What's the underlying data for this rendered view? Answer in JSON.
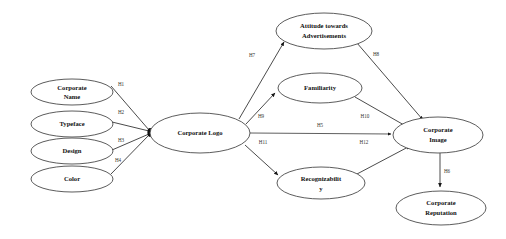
{
  "diagram": {
    "background_color": "#ffffff",
    "node_stroke_color": "#4a4a4a",
    "edge_color": "#2a2a2a",
    "text_color": "#111111",
    "nodes": [
      {
        "id": "corporate-name",
        "label_line1": "Corporate",
        "label_line2": "Name",
        "cx": 72,
        "cy": 92,
        "rx": 41,
        "ry": 13
      },
      {
        "id": "typeface",
        "label_line1": "Typeface",
        "label_line2": "",
        "cx": 72,
        "cy": 124,
        "rx": 41,
        "ry": 13
      },
      {
        "id": "design",
        "label_line1": "Design",
        "label_line2": "",
        "cx": 72,
        "cy": 151,
        "rx": 41,
        "ry": 13
      },
      {
        "id": "color",
        "label_line1": "Color",
        "label_line2": "",
        "cx": 72,
        "cy": 179,
        "rx": 41,
        "ry": 13
      },
      {
        "id": "corporate-logo",
        "label_line1": "Corporate Logo",
        "label_line2": "",
        "cx": 200,
        "cy": 133,
        "rx": 50,
        "ry": 20
      },
      {
        "id": "attitude-towards-ads",
        "label_line1": "Attitude towards",
        "label_line2": "Advertisements",
        "cx": 324,
        "cy": 31,
        "rx": 48,
        "ry": 18
      },
      {
        "id": "familiarity",
        "label_line1": "Familiarity",
        "label_line2": "",
        "cx": 320,
        "cy": 88,
        "rx": 42,
        "ry": 15
      },
      {
        "id": "recognizability",
        "label_line1": "Recognizabilit",
        "label_line2": "y",
        "cx": 321,
        "cy": 183,
        "rx": 44,
        "ry": 16
      },
      {
        "id": "corporate-image",
        "label_line1": "Corporate",
        "label_line2": "Image",
        "cx": 438,
        "cy": 135,
        "rx": 45,
        "ry": 18
      },
      {
        "id": "corporate-reputation",
        "label_line1": "Corporate",
        "label_line2": "Reputation",
        "cx": 441,
        "cy": 208,
        "rx": 45,
        "ry": 17
      }
    ],
    "edges": [
      {
        "id": "h1",
        "label": "H1",
        "from": "corporate-name",
        "to": "corporate-logo",
        "label_x": 121,
        "label_y": 85
      },
      {
        "id": "h2",
        "label": "H2",
        "from": "typeface",
        "to": "corporate-logo",
        "label_x": 121,
        "label_y": 113
      },
      {
        "id": "h3",
        "label": "H3",
        "from": "design",
        "to": "corporate-logo",
        "label_x": 121,
        "label_y": 141
      },
      {
        "id": "h4",
        "label": "H4",
        "from": "color",
        "to": "corporate-logo",
        "label_x": 118,
        "label_y": 161
      },
      {
        "id": "h7",
        "label": "H7",
        "from": "corporate-logo",
        "to": "attitude-towards-ads",
        "label_x": 252,
        "label_y": 56
      },
      {
        "id": "h8",
        "label": "H8",
        "from": "attitude-towards-ads",
        "to": "corporate-image",
        "label_x": 376,
        "label_y": 55
      },
      {
        "id": "h9",
        "label": "H9",
        "from": "corporate-logo",
        "to": "familiarity",
        "label_x": 261,
        "label_y": 117
      },
      {
        "id": "h10",
        "label": "H10",
        "from": "familiarity",
        "to": "corporate-image",
        "label_x": 365,
        "label_y": 117
      },
      {
        "id": "h5",
        "label": "H5",
        "from": "corporate-logo",
        "to": "corporate-image",
        "label_x": 320,
        "label_y": 126
      },
      {
        "id": "h11",
        "label": "H11",
        "from": "corporate-logo",
        "to": "recognizability",
        "label_x": 263,
        "label_y": 143
      },
      {
        "id": "h12",
        "label": "H12",
        "from": "recognizability",
        "to": "corporate-image",
        "label_x": 364,
        "label_y": 143
      },
      {
        "id": "h6",
        "label": "H6",
        "from": "corporate-image",
        "to": "corporate-reputation",
        "label_x": 447,
        "label_y": 172
      }
    ]
  }
}
